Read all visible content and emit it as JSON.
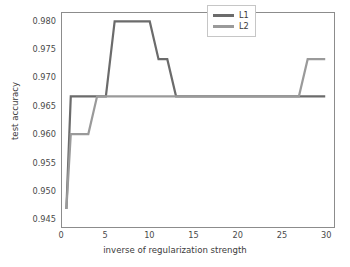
{
  "chart_data": {
    "type": "line",
    "title": "",
    "xlabel": "inverse of regularization strength",
    "ylabel": "test accuracy",
    "xlim": [
      0,
      31
    ],
    "ylim": [
      0.9435,
      0.9815
    ],
    "xticks": [
      "0",
      "5",
      "10",
      "15",
      "20",
      "25",
      "30"
    ],
    "xtick_values": [
      0,
      5,
      10,
      15,
      20,
      25,
      30
    ],
    "yticks": [
      "0.945",
      "0.950",
      "0.955",
      "0.960",
      "0.965",
      "0.970",
      "0.975",
      "0.980"
    ],
    "ytick_values": [
      0.945,
      0.95,
      0.955,
      0.96,
      0.965,
      0.97,
      0.975,
      0.98
    ],
    "grid": false,
    "legend_position": "upper right",
    "series": [
      {
        "name": "L1",
        "color": "#6b6b6b",
        "x": [
          0.5,
          1.0,
          2.0,
          3.0,
          4.0,
          5.0,
          6.0,
          7.0,
          8.0,
          9.0,
          10.0,
          11.0,
          12.0,
          13.0,
          14.0,
          15.0,
          16.0,
          18.0,
          20.0,
          22.0,
          24.0,
          26.0,
          28.0,
          30.0
        ],
        "y": [
          0.9467,
          0.9667,
          0.9667,
          0.9667,
          0.9667,
          0.9667,
          0.98,
          0.98,
          0.98,
          0.98,
          0.98,
          0.9733,
          0.9733,
          0.9667,
          0.9667,
          0.9667,
          0.9667,
          0.9667,
          0.9667,
          0.9667,
          0.9667,
          0.9667,
          0.9667,
          0.9667
        ]
      },
      {
        "name": "L2",
        "color": "#9a9a9a",
        "x": [
          0.5,
          1.0,
          2.0,
          3.0,
          4.0,
          5.0,
          6.0,
          8.0,
          10.0,
          12.0,
          14.0,
          16.0,
          18.0,
          20.0,
          22.0,
          24.0,
          26.0,
          27.0,
          28.0,
          29.0,
          30.0
        ],
        "y": [
          0.9467,
          0.96,
          0.96,
          0.96,
          0.9667,
          0.9667,
          0.9667,
          0.9667,
          0.9667,
          0.9667,
          0.9667,
          0.9667,
          0.9667,
          0.9667,
          0.9667,
          0.9667,
          0.9667,
          0.9667,
          0.9733,
          0.9733,
          0.9733
        ]
      }
    ]
  },
  "legend": {
    "entries": [
      {
        "label": "L1"
      },
      {
        "label": "L2"
      }
    ]
  },
  "colors": {
    "l1": "#6b6b6b",
    "l2": "#9a9a9a",
    "axis": "#8c8c8c",
    "text": "#3b3b3b",
    "background": "#ffffff"
  }
}
